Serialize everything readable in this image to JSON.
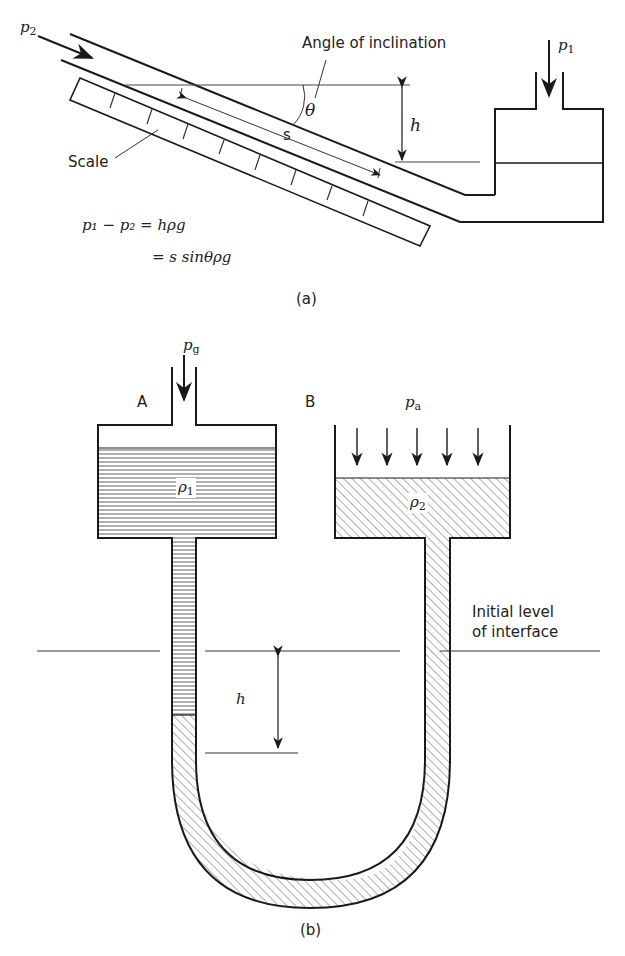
{
  "figure_a": {
    "label": "(a)",
    "inlet_pressure": "p",
    "inlet_sub": "2",
    "reservoir_pressure": "p",
    "reservoir_sub": "1",
    "angle_label": "Angle of inclination",
    "angle_symbol": "θ",
    "height_symbol": "h",
    "distance_symbol": "s",
    "scale_label": "Scale",
    "equation_line1": "p₁ − p₂ = hρg",
    "equation_line2": "= s sinθρg"
  },
  "figure_b": {
    "label": "(b)",
    "vessel_a_label": "A",
    "vessel_b_label": "B",
    "gas_pressure": "p",
    "gas_sub": "g",
    "atm_pressure": "p",
    "atm_sub": "a",
    "fluid_a_density": "ρ",
    "fluid_a_sub": "1",
    "fluid_b_density": "ρ",
    "fluid_b_sub": "2",
    "interface_label_line1": "Initial level",
    "interface_label_line2": "of interface",
    "height_symbol": "h"
  },
  "colors": {
    "line": "#1a1a1a",
    "background": "#ffffff"
  }
}
